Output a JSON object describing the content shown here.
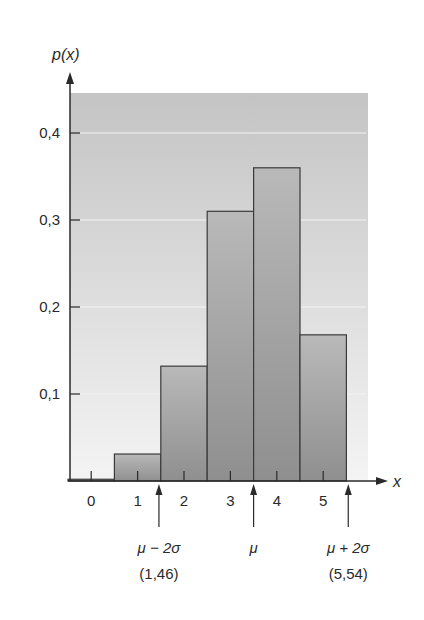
{
  "chart_data": {
    "type": "bar",
    "title": "",
    "xlabel": "x",
    "ylabel": "p(x)",
    "categories": [
      "0",
      "1",
      "2",
      "3",
      "4",
      "5"
    ],
    "values": [
      0.002,
      0.031,
      0.132,
      0.31,
      0.36,
      0.168
    ],
    "ylim": [
      0,
      0.44
    ],
    "yticks": [
      0.1,
      0.2,
      0.3,
      0.4
    ],
    "ytick_labels": [
      "0,1",
      "0,2",
      "0,3",
      "0,4"
    ],
    "grid": true,
    "legend": null,
    "annotations": [
      {
        "x": 1.46,
        "label": "μ − 2σ",
        "value_label": "(1,46)"
      },
      {
        "x": 3.5,
        "label": "μ",
        "value_label": ""
      },
      {
        "x": 5.54,
        "label": "μ + 2σ",
        "value_label": "(5,54)"
      }
    ]
  },
  "colors": {
    "background_top": "#c4c4c4",
    "background_bottom": "#f2f2f2",
    "bar_top": "#b8b8b8",
    "bar_bottom": "#9a9a9a",
    "axis": "#2a2a2a",
    "gridline": "#f4f4f4"
  }
}
